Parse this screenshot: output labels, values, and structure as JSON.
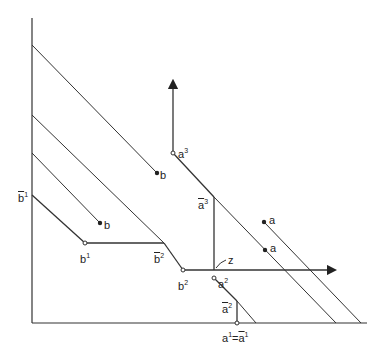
{
  "diagram": {
    "type": "economic-geometry",
    "axes": {
      "origin": [
        32,
        323
      ],
      "x_end": 367,
      "y_end": 18
    },
    "labels": {
      "b_top": {
        "base": "b",
        "sup": ""
      },
      "b_mid": {
        "base": "b",
        "sup": ""
      },
      "b_bar_1": {
        "base": "b",
        "sup": "1"
      },
      "b_1": {
        "base": "b",
        "sup": "1"
      },
      "b_bar_2": {
        "base": "b",
        "sup": "2"
      },
      "b_2": {
        "base": "b",
        "sup": "2"
      },
      "a_3": {
        "base": "a",
        "sup": "3"
      },
      "a_bar_3": {
        "base": "a",
        "sup": "3"
      },
      "a_top": {
        "base": "a",
        "sup": ""
      },
      "a_mid": {
        "base": "a",
        "sup": ""
      },
      "z": {
        "base": "z",
        "sup": ""
      },
      "a_2": {
        "base": "a",
        "sup": "2"
      },
      "a_bar_2": {
        "base": "a",
        "sup": "2"
      },
      "a_1_eq": {
        "base": "a",
        "sup": "1",
        "eq": "=",
        "base2": "a",
        "sup2": "1"
      }
    }
  }
}
